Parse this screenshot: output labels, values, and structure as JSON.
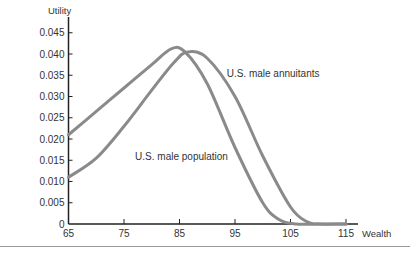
{
  "chart_data": {
    "type": "line",
    "title": "",
    "xlabel": "Wealth",
    "ylabel": "Utility",
    "xlim": [
      65,
      115
    ],
    "ylim": [
      0,
      0.045
    ],
    "x_ticks": [
      "65",
      "75",
      "85",
      "95",
      "105",
      "115"
    ],
    "y_ticks": [
      "0",
      "0.005",
      "0.010",
      "0.015",
      "0.020",
      "0.025",
      "0.030",
      "0.035",
      "0.040",
      "0.045"
    ],
    "grid": false,
    "legend": "inline labels",
    "series": [
      {
        "name": "U.S. male population",
        "x": [
          65,
          70,
          75,
          80,
          83.5,
          86,
          90,
          95,
          100,
          103,
          106,
          110,
          115
        ],
        "values": [
          0.021,
          0.0265,
          0.032,
          0.0375,
          0.0412,
          0.0405,
          0.033,
          0.018,
          0.005,
          0.001,
          0.0,
          0.0,
          0.0
        ]
      },
      {
        "name": "U.S. male annuitants",
        "x": [
          65,
          70,
          75,
          80,
          84,
          86.5,
          90,
          95,
          100,
          105,
          108,
          110,
          115
        ],
        "values": [
          0.011,
          0.0155,
          0.023,
          0.0315,
          0.038,
          0.0405,
          0.039,
          0.03,
          0.016,
          0.004,
          0.0005,
          0.0,
          0.0
        ]
      }
    ],
    "annotations": [
      {
        "text": "U.S. male annuitants",
        "x": 93.5,
        "y": 0.0345
      },
      {
        "text": "U.S. male population",
        "x": 77,
        "y": 0.015
      }
    ]
  },
  "colors": {
    "curve": "#8a8a8a",
    "axis": "#222222",
    "rule": "#9a9a9a"
  }
}
